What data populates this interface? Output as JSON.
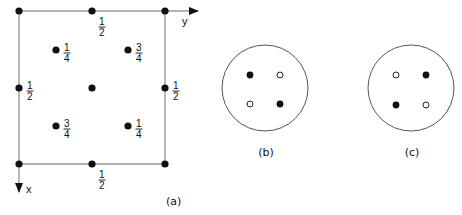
{
  "panel_a": {
    "label": "(a)",
    "axis_y_label": "y",
    "axis_x_label": "x",
    "frame": {
      "x0": 19,
      "y0": 11,
      "x1": 165,
      "y1": 164
    },
    "points": [
      {
        "x": 19,
        "y": 11,
        "height": ""
      },
      {
        "x": 92,
        "y": 11,
        "height": "1/2",
        "num": "1",
        "den": "2",
        "label_pos": "below-right"
      },
      {
        "x": 165,
        "y": 11,
        "height": ""
      },
      {
        "x": 56,
        "y": 50,
        "height": "1/4",
        "num": "1",
        "den": "4",
        "label_pos": "right"
      },
      {
        "x": 128,
        "y": 50,
        "height": "3/4",
        "num": "3",
        "den": "4",
        "label_pos": "right"
      },
      {
        "x": 19,
        "y": 88,
        "height": "1/2",
        "num": "1",
        "den": "2",
        "label_pos": "right"
      },
      {
        "x": 92,
        "y": 88,
        "height": ""
      },
      {
        "x": 165,
        "y": 88,
        "height": "1/2",
        "num": "1",
        "den": "2",
        "label_pos": "right"
      },
      {
        "x": 56,
        "y": 126,
        "height": "3/4",
        "num": "3",
        "den": "4",
        "label_pos": "right"
      },
      {
        "x": 128,
        "y": 126,
        "height": "1/4",
        "num": "1",
        "den": "4",
        "label_pos": "right"
      },
      {
        "x": 19,
        "y": 164,
        "height": ""
      },
      {
        "x": 92,
        "y": 164,
        "height": "1/2",
        "num": "1",
        "den": "2",
        "label_pos": "below-right"
      },
      {
        "x": 165,
        "y": 164,
        "height": ""
      }
    ]
  },
  "panel_b": {
    "label": "(b)",
    "circle": {
      "cx": 265,
      "cy": 88,
      "r": 43
    },
    "points": [
      {
        "x": 250,
        "y": 75,
        "type": "filled"
      },
      {
        "x": 280,
        "y": 75,
        "type": "open"
      },
      {
        "x": 250,
        "y": 104,
        "type": "open"
      },
      {
        "x": 280,
        "y": 104,
        "type": "filled"
      }
    ]
  },
  "panel_c": {
    "label": "(c)",
    "circle": {
      "cx": 411,
      "cy": 88,
      "r": 43
    },
    "points": [
      {
        "x": 396,
        "y": 75,
        "type": "open"
      },
      {
        "x": 426,
        "y": 75,
        "type": "filled"
      },
      {
        "x": 396,
        "y": 105,
        "type": "filled"
      },
      {
        "x": 426,
        "y": 105,
        "type": "open"
      }
    ]
  },
  "colors": {
    "line": "#9a9a9a",
    "ink": "#111111",
    "circle": "#555555"
  }
}
